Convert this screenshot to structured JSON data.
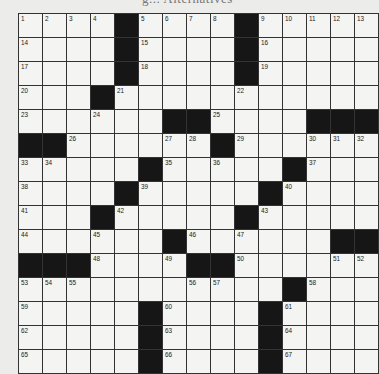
{
  "puzzle": {
    "title": "g... Alternatives",
    "rows": 15,
    "cols": 15,
    "colors": {
      "black": "#161616",
      "white": "#f4f4f2",
      "border": "#333333"
    },
    "grid": [
      [
        "1",
        "2",
        "3",
        "4",
        "#",
        "5",
        "6",
        "7",
        "8",
        "#",
        "9",
        "10",
        "11",
        "12",
        "13"
      ],
      [
        "14",
        "",
        "",
        "",
        "#",
        "15",
        "",
        "",
        "",
        "#",
        "16",
        "",
        "",
        "",
        ""
      ],
      [
        "17",
        "",
        "",
        "",
        "#",
        "18",
        "",
        "",
        "",
        "#",
        "19",
        "",
        "",
        "",
        ""
      ],
      [
        "20",
        "",
        "",
        "#",
        "21",
        "",
        "",
        "",
        "",
        "22",
        "",
        "",
        "",
        "",
        ""
      ],
      [
        "23",
        "",
        "",
        "24",
        "",
        "",
        "#",
        "#",
        "25",
        "",
        "",
        "",
        "#",
        "#",
        "#"
      ],
      [
        "#",
        "#",
        "26",
        "",
        "",
        "",
        "27",
        "28",
        "#",
        "29",
        "",
        "",
        "30",
        "31",
        "32"
      ],
      [
        "33",
        "34",
        "",
        "",
        "",
        "#",
        "35",
        "",
        "36",
        "",
        "",
        "#",
        "37",
        "",
        ""
      ],
      [
        "38",
        "",
        "",
        "",
        "#",
        "39",
        "",
        "",
        "",
        "",
        "#",
        "40",
        "",
        "",
        ""
      ],
      [
        "41",
        "",
        "",
        "#",
        "42",
        "",
        "",
        "",
        "",
        "#",
        "43",
        "",
        "",
        "",
        ""
      ],
      [
        "44",
        "",
        "",
        "45",
        "",
        "",
        "#",
        "46",
        "",
        "47",
        "",
        "",
        "",
        "#",
        "#"
      ],
      [
        "#",
        "#",
        "#",
        "48",
        "",
        "",
        "49",
        "#",
        "#",
        "50",
        "",
        "",
        "",
        "51",
        "52"
      ],
      [
        "53",
        "54",
        "55",
        "",
        "",
        "",
        "",
        "56",
        "57",
        "",
        "",
        "#",
        "58",
        "",
        ""
      ],
      [
        "59",
        "",
        "",
        "",
        "",
        "#",
        "60",
        "",
        "",
        "",
        "#",
        "61",
        "",
        "",
        ""
      ],
      [
        "62",
        "",
        "",
        "",
        "",
        "#",
        "63",
        "",
        "",
        "",
        "#",
        "64",
        "",
        "",
        ""
      ],
      [
        "65",
        "",
        "",
        "",
        "",
        "#",
        "66",
        "",
        "",
        "",
        "#",
        "67",
        "",
        "",
        ""
      ]
    ]
  }
}
